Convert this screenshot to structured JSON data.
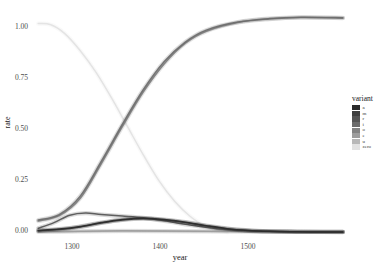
{
  "chart_data": {
    "type": "line",
    "title": "",
    "xlabel": "year",
    "ylabel": "rate",
    "xlim": [
      1275,
      1572
    ],
    "ylim": [
      0.0,
      1.0
    ],
    "xticks": [
      1300,
      1400,
      1500
    ],
    "xtick_labels": [
      "1300",
      "1400",
      "1500"
    ],
    "yticks": [
      0.0,
      0.25,
      0.5,
      0.75,
      1.0
    ],
    "ytick_labels": [
      "0.00",
      "0.25",
      "0.50",
      "0.75",
      "1.00"
    ],
    "grid": false,
    "legend_position": "right",
    "legend_title": "variant",
    "band_style": "ribbon",
    "series": [
      {
        "name": "a",
        "color": "#2b2b2b",
        "x": [
          1280,
          1300,
          1320,
          1340,
          1360,
          1380,
          1400,
          1420,
          1440,
          1460,
          1480,
          1500,
          1520,
          1540,
          1570
        ],
        "values": [
          0.012,
          0.018,
          0.03,
          0.048,
          0.062,
          0.068,
          0.062,
          0.05,
          0.034,
          0.02,
          0.012,
          0.008,
          0.006,
          0.005,
          0.005
        ]
      },
      {
        "name": "m",
        "color": "#3f3f3f",
        "x": [
          1280,
          1300,
          1320,
          1340,
          1360,
          1380,
          1400,
          1420,
          1440,
          1460,
          1480,
          1500,
          1520,
          1540,
          1570
        ],
        "values": [
          0.01,
          0.016,
          0.028,
          0.046,
          0.06,
          0.066,
          0.06,
          0.048,
          0.032,
          0.019,
          0.011,
          0.008,
          0.006,
          0.005,
          0.005
        ]
      },
      {
        "name": "r",
        "color": "#545454",
        "x": [
          1280,
          1295,
          1310,
          1325,
          1340,
          1360,
          1380,
          1400,
          1420,
          1450,
          1480,
          1510,
          1540,
          1570
        ],
        "values": [
          0.022,
          0.048,
          0.082,
          0.092,
          0.085,
          0.078,
          0.07,
          0.056,
          0.04,
          0.02,
          0.01,
          0.006,
          0.005,
          0.004
        ]
      },
      {
        "name": "i",
        "color": "#6b6b6b",
        "x": [
          1280,
          1300,
          1320,
          1340,
          1360,
          1380,
          1400,
          1420,
          1440,
          1470,
          1500,
          1530,
          1570
        ],
        "values": [
          0.06,
          0.085,
          0.17,
          0.33,
          0.5,
          0.66,
          0.79,
          0.88,
          0.935,
          0.972,
          0.988,
          0.994,
          0.992
        ]
      },
      {
        "name": "o",
        "color": "#838383",
        "x": [
          1280,
          1300,
          1320,
          1340,
          1360,
          1380,
          1400,
          1420,
          1440,
          1470,
          1500,
          1530,
          1570
        ],
        "values": [
          0.055,
          0.08,
          0.16,
          0.32,
          0.49,
          0.65,
          0.78,
          0.875,
          0.93,
          0.97,
          0.986,
          0.993,
          0.99
        ]
      },
      {
        "name": "e",
        "color": "#9d9d9d",
        "x": [
          1280,
          1320,
          1360,
          1400,
          1440,
          1480,
          1520,
          1570
        ],
        "values": [
          0.006,
          0.008,
          0.01,
          0.009,
          0.008,
          0.007,
          0.006,
          0.005
        ]
      },
      {
        "name": "u",
        "color": "#b8b8b8",
        "x": [
          1280,
          1320,
          1360,
          1400,
          1440,
          1480,
          1520,
          1570
        ],
        "values": [
          0.005,
          0.007,
          0.009,
          0.008,
          0.007,
          0.006,
          0.005,
          0.004
        ]
      },
      {
        "name": "zero",
        "color": "#e2e2e2",
        "x": [
          1280,
          1292,
          1305,
          1320,
          1335,
          1350,
          1365,
          1380,
          1395,
          1410,
          1425,
          1440,
          1460
        ],
        "values": [
          0.965,
          0.96,
          0.92,
          0.84,
          0.74,
          0.62,
          0.49,
          0.36,
          0.24,
          0.145,
          0.075,
          0.03,
          0.004
        ]
      }
    ]
  },
  "axes": {
    "y_title": "rate",
    "x_title": "year",
    "y_labels": [
      "1.00",
      "0.75",
      "0.50",
      "0.25",
      "0.00"
    ],
    "x_labels": [
      "1300",
      "1400",
      "1500"
    ]
  },
  "legend": {
    "title": "variant",
    "items": [
      {
        "label": "a",
        "color": "#2b2b2b"
      },
      {
        "label": "m",
        "color": "#3f3f3f"
      },
      {
        "label": "r",
        "color": "#545454"
      },
      {
        "label": "i",
        "color": "#6b6b6b"
      },
      {
        "label": "o",
        "color": "#838383"
      },
      {
        "label": "e",
        "color": "#9d9d9d"
      },
      {
        "label": "u",
        "color": "#b8b8b8"
      },
      {
        "label": "zero",
        "color": "#e2e2e2"
      }
    ]
  }
}
